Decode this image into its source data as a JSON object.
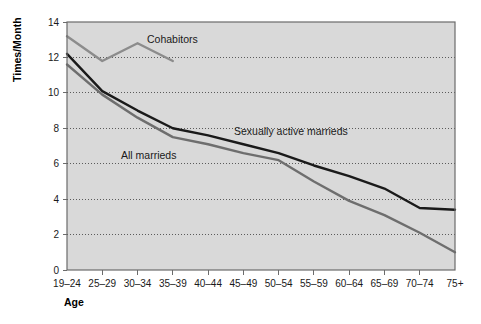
{
  "chart_data": {
    "type": "line",
    "title": "",
    "xlabel": "Age",
    "ylabel": "Times/Month",
    "categories": [
      "19-24",
      "25-29",
      "30-34",
      "35-39",
      "40-44",
      "45-49",
      "50-54",
      "55-59",
      "60-64",
      "65-69",
      "70-74",
      "75+"
    ],
    "ylim": [
      0,
      14
    ],
    "yticks": [
      "0",
      "2",
      "4",
      "6",
      "8",
      "10",
      "12",
      "14"
    ],
    "grid": "horizontal-dotted",
    "legend": "inline-annotations",
    "series": [
      {
        "name": "Cohabitors",
        "color": "#8c8c8c",
        "values": [
          13.2,
          11.8,
          12.8,
          11.8,
          null,
          null,
          null,
          null,
          null,
          null,
          null,
          null
        ]
      },
      {
        "name": "Sexually active marrieds",
        "color": "#1a1a1a",
        "values": [
          12.2,
          10.1,
          9.0,
          8.0,
          7.6,
          7.1,
          6.6,
          5.9,
          5.3,
          4.6,
          3.5,
          3.4
        ]
      },
      {
        "name": "All marrieds",
        "color": "#6e6e6e",
        "values": [
          11.6,
          9.9,
          8.6,
          7.5,
          7.1,
          6.6,
          6.2,
          5.0,
          3.9,
          3.1,
          2.1,
          1.0
        ]
      }
    ],
    "annotations": [
      {
        "text": "Cohabitors",
        "x": 147,
        "y": 43
      },
      {
        "text": "Sexually active marrieds",
        "x": 234,
        "y": 135
      },
      {
        "text": "All marrieds",
        "x": 121,
        "y": 159
      }
    ],
    "colors": {
      "plot_background": "#d9d9d9",
      "plot_border": "#6b6b6b",
      "gridline": "#4d4d4d",
      "page_background": "#ffffff",
      "axis_text": "#1a1a1a"
    }
  }
}
